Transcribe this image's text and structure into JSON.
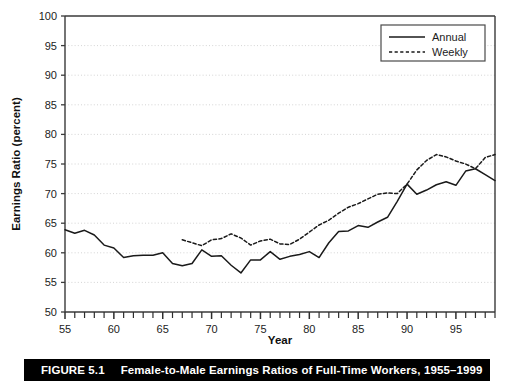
{
  "figure": {
    "caption_number": "FIGURE 5.1",
    "caption_text": "Female-to-Male Earnings Ratios of Full-Time Workers, 1955–1999"
  },
  "chart_data": {
    "type": "line",
    "title": "",
    "xlabel": "Year",
    "ylabel": "Earnings Ratio (percent)",
    "xlim": [
      55,
      99
    ],
    "ylim": [
      50,
      100
    ],
    "yticks": [
      50,
      55,
      60,
      65,
      70,
      75,
      80,
      85,
      90,
      95,
      100
    ],
    "ytick_labels": [
      "50",
      "55",
      "60",
      "65",
      "70",
      "75",
      "80",
      "85",
      "90",
      "95",
      "100"
    ],
    "xticks": [
      55,
      60,
      65,
      70,
      75,
      80,
      85,
      90,
      95
    ],
    "xtick_labels": [
      "55",
      "60",
      "65",
      "70",
      "75",
      "80",
      "85",
      "90",
      "95"
    ],
    "x_minor_tick_interval": 1,
    "grid": "horizontal-dotted",
    "legend_position": "top-right",
    "legend_entries": [
      "Annual",
      "Weekly"
    ],
    "series": [
      {
        "name": "Annual",
        "style": "solid",
        "color": "#1a1a1a",
        "x": [
          55,
          56,
          57,
          58,
          59,
          60,
          61,
          62,
          63,
          64,
          65,
          66,
          67,
          68,
          69,
          70,
          71,
          72,
          73,
          74,
          75,
          76,
          77,
          78,
          79,
          80,
          81,
          82,
          83,
          84,
          85,
          86,
          87,
          88,
          89,
          90,
          91,
          92,
          93,
          94,
          95,
          96,
          97,
          98,
          99
        ],
        "y": [
          63.9,
          63.3,
          63.8,
          63.0,
          61.3,
          60.8,
          59.2,
          59.5,
          59.6,
          59.6,
          60.0,
          58.2,
          57.8,
          58.2,
          60.5,
          59.4,
          59.5,
          57.9,
          56.6,
          58.8,
          58.8,
          60.2,
          58.9,
          59.4,
          59.7,
          60.2,
          59.2,
          61.7,
          63.6,
          63.7,
          64.6,
          64.3,
          65.2,
          66.0,
          68.7,
          71.6,
          69.9,
          70.6,
          71.5,
          72.0,
          71.4,
          73.8,
          74.2,
          73.2,
          72.2
        ]
      },
      {
        "name": "Weekly",
        "style": "dotted",
        "color": "#1a1a1a",
        "x": [
          67,
          68,
          69,
          70,
          71,
          72,
          73,
          74,
          75,
          76,
          77,
          78,
          79,
          80,
          81,
          82,
          83,
          84,
          85,
          86,
          87,
          88,
          89,
          90,
          91,
          92,
          93,
          94,
          95,
          96,
          97,
          98,
          99
        ],
        "y": [
          62.2,
          61.7,
          61.2,
          62.2,
          62.4,
          63.2,
          62.5,
          61.3,
          62.0,
          62.3,
          61.5,
          61.4,
          62.3,
          63.5,
          64.7,
          65.5,
          66.7,
          67.7,
          68.3,
          69.1,
          69.9,
          70.1,
          70.0,
          71.6,
          74.0,
          75.6,
          76.6,
          76.2,
          75.5,
          75.0,
          74.2,
          76.1,
          76.6
        ]
      }
    ]
  }
}
